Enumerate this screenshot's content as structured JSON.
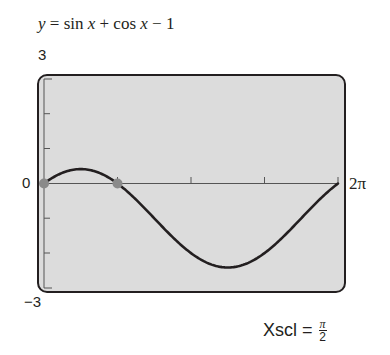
{
  "title": {
    "lhs": "y",
    "eq": " = sin ",
    "x1": "x",
    "plus": " + cos ",
    "x2": "x",
    "rest": " − 1"
  },
  "labels": {
    "ymax": "3",
    "ymin": "−3",
    "xmin": "0",
    "xmax": "2π",
    "xscl_label": "Xscl =",
    "xscl_num": "π",
    "xscl_den": "2"
  },
  "colors": {
    "screen": "#dcdcdc",
    "curve": "#231f20",
    "point": "#8a8a8a",
    "border": "#231f20"
  },
  "chart_data": {
    "type": "line",
    "title": "y = sin x + cos x − 1",
    "xlabel": "",
    "ylabel": "",
    "xlim": [
      0,
      6.2832
    ],
    "ylim": [
      -3,
      3
    ],
    "x_tick_step": "π/2",
    "y_tick_step": 1,
    "x_tick_labels": [
      "0",
      "2π"
    ],
    "y_tick_labels": [
      "3",
      "−3"
    ],
    "grid": false,
    "series": [
      {
        "name": "y = sin x + cos x − 1",
        "x": [
          0,
          0.3927,
          0.7854,
          1.1781,
          1.5708,
          1.9635,
          2.3562,
          2.7489,
          3.1416,
          3.5343,
          3.927,
          4.3197,
          4.7124,
          5.1051,
          5.4978,
          5.8905,
          6.2832
        ],
        "y": [
          0,
          0.307,
          0.414,
          0.307,
          0,
          -0.459,
          -1,
          -1.541,
          -2,
          -2.307,
          -2.414,
          -2.307,
          -2,
          -1.541,
          -1,
          -0.459,
          0
        ]
      }
    ],
    "highlighted_points": [
      {
        "x": 0,
        "y": 0
      },
      {
        "x": 1.5708,
        "y": 0
      }
    ]
  }
}
